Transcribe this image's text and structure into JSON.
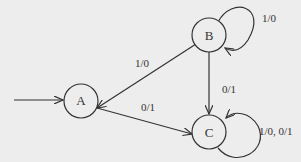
{
  "diagram": {
    "type": "state-machine",
    "start_state": "A",
    "states": [
      {
        "id": "A",
        "label": "A"
      },
      {
        "id": "B",
        "label": "B"
      },
      {
        "id": "C",
        "label": "C"
      }
    ],
    "transitions": [
      {
        "from": "B",
        "to": "A",
        "label": "1/0"
      },
      {
        "from": "A",
        "to": "C",
        "label": "0/1"
      },
      {
        "from": "B",
        "to": "C",
        "label": "0/1"
      },
      {
        "from": "B",
        "to": "B",
        "label": "1/0"
      },
      {
        "from": "C",
        "to": "C",
        "label": "1/0, 0/1"
      }
    ],
    "colors": {
      "line": "#333333",
      "background": "#ededed"
    }
  }
}
